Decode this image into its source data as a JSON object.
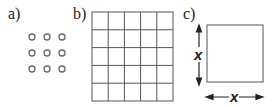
{
  "panels": [
    {
      "label": "a)",
      "content": "3x3 array of small circles"
    },
    {
      "label": "b)",
      "content": "5x5 grid of squares"
    },
    {
      "label": "c)",
      "content": "square with side length x"
    }
  ],
  "dimension_label_vertical": "x",
  "dimension_label_horizontal": "x",
  "colors": {
    "stroke": "#555555",
    "text": "#222222"
  }
}
